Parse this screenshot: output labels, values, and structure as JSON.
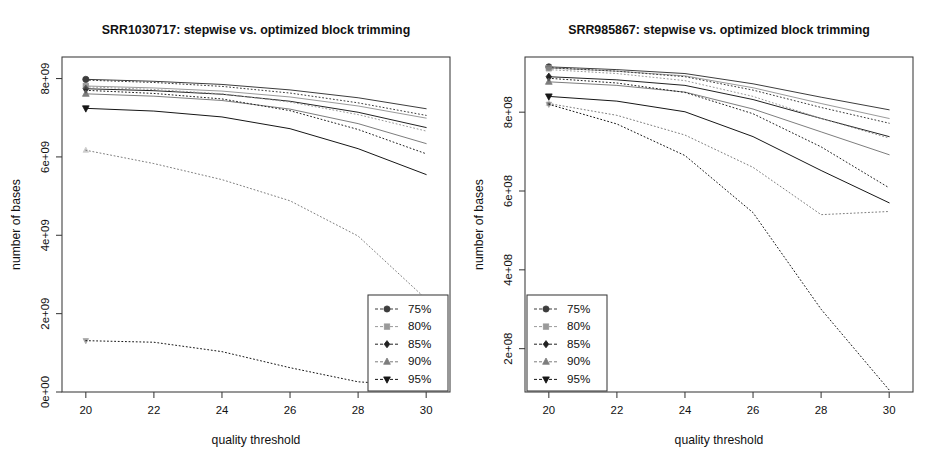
{
  "figure": {
    "width": 926,
    "height": 465,
    "background": "#ffffff",
    "ink": "#111111",
    "axis_color": "#3a3a3a"
  },
  "series_styles": [
    {
      "key": "75",
      "label": "75%",
      "marker": "circle",
      "color": "#3d3d3d"
    },
    {
      "key": "80",
      "label": "80%",
      "marker": "square",
      "color": "#9a9a9a"
    },
    {
      "key": "85",
      "label": "85%",
      "marker": "diamond",
      "color": "#222222"
    },
    {
      "key": "90",
      "label": "90%",
      "marker": "triangle-up",
      "color": "#7d7d7d"
    },
    {
      "key": "95",
      "label": "95%",
      "marker": "triangle-down",
      "color": "#161616"
    }
  ],
  "method_styles": [
    {
      "key": "optimized",
      "dash": "none",
      "width": 1.0
    },
    {
      "key": "stepwise",
      "dash": "1,2.6",
      "width": 1.0
    }
  ],
  "legend": {
    "entries": [
      "75%",
      "80%",
      "85%",
      "90%",
      "95%"
    ]
  },
  "chart_data": [
    {
      "type": "line",
      "panel": "left",
      "title": "SRR1030717: stepwise vs. optimized block trimming",
      "xlabel": "quality threshold",
      "ylabel": "number of bases",
      "x": [
        20,
        22,
        24,
        26,
        28,
        30
      ],
      "xlim": [
        19.3,
        30.7
      ],
      "ylim": [
        0,
        8550000000.0
      ],
      "xticks": [
        20,
        22,
        24,
        26,
        28,
        30
      ],
      "xtick_labels": [
        "20",
        "22",
        "24",
        "26",
        "28",
        "30"
      ],
      "yticks": [
        0,
        2000000000,
        4000000000,
        6000000000,
        8000000000
      ],
      "ytick_labels": [
        "0e+00",
        "2e+09",
        "4e+09",
        "6e+09",
        "8e+09"
      ],
      "grid": false,
      "legend_position": "bottom-right",
      "series": [
        {
          "name": "75% optimized",
          "quality": "75",
          "method": "optimized",
          "values": [
            7980000000,
            7930000000,
            7850000000,
            7710000000,
            7510000000,
            7230000000
          ]
        },
        {
          "name": "80% optimized",
          "quality": "80",
          "method": "optimized",
          "values": [
            7810000000,
            7760000000,
            7680000000,
            7530000000,
            7300000000,
            6990000000
          ]
        },
        {
          "name": "85% optimized",
          "quality": "85",
          "method": "optimized",
          "values": [
            7740000000,
            7690000000,
            7600000000,
            7420000000,
            7140000000,
            6750000000
          ]
        },
        {
          "name": "90% optimized",
          "quality": "90",
          "method": "optimized",
          "values": [
            7610000000,
            7550000000,
            7440000000,
            7220000000,
            6850000000,
            6340000000
          ]
        },
        {
          "name": "95% optimized",
          "quality": "95",
          "method": "optimized",
          "values": [
            7240000000,
            7170000000,
            7020000000,
            6720000000,
            6210000000,
            5550000000
          ]
        },
        {
          "name": "75% stepwise",
          "quality": "75",
          "method": "stepwise",
          "values": [
            7960000000,
            7900000000,
            7800000000,
            7630000000,
            7380000000,
            7060000000
          ]
        },
        {
          "name": "80% stepwise",
          "quality": "80",
          "method": "stepwise",
          "values": [
            7790000000,
            7720000000,
            7610000000,
            7400000000,
            7080000000,
            6660000000
          ]
        },
        {
          "name": "85% stepwise",
          "quality": "85",
          "method": "stepwise",
          "values": [
            7700000000,
            7620000000,
            7480000000,
            7180000000,
            6700000000,
            6080000000
          ]
        },
        {
          "name": "90% stepwise",
          "quality": "90",
          "method": "stepwise",
          "values": [
            6170000000,
            5830000000,
            5420000000,
            4880000000,
            3980000000,
            2370000000
          ]
        },
        {
          "name": "95% stepwise",
          "quality": "95",
          "method": "stepwise",
          "values": [
            1310000000,
            1270000000,
            1030000000,
            620000000,
            260000000,
            150000000
          ]
        }
      ]
    },
    {
      "type": "line",
      "panel": "right",
      "title": "SRR985867: stepwise vs. optimized block trimming",
      "xlabel": "quality threshold",
      "ylabel": "number of bases",
      "x": [
        20,
        22,
        24,
        26,
        28,
        30
      ],
      "xlim": [
        19.3,
        30.7
      ],
      "ylim": [
        90000000,
        940000000
      ],
      "xticks": [
        20,
        22,
        24,
        26,
        28,
        30
      ],
      "xtick_labels": [
        "20",
        "22",
        "24",
        "26",
        "28",
        "30"
      ],
      "yticks": [
        200000000,
        400000000,
        600000000,
        800000000
      ],
      "ytick_labels": [
        "2e+08",
        "4e+08",
        "6e+08",
        "8e+08"
      ],
      "grid": false,
      "legend_position": "bottom-left",
      "series": [
        {
          "name": "75% optimized",
          "quality": "75",
          "method": "optimized",
          "values": [
            915000000,
            908000000,
            898000000,
            872000000,
            838000000,
            806000000
          ]
        },
        {
          "name": "80% optimized",
          "quality": "80",
          "method": "optimized",
          "values": [
            912000000,
            904000000,
            892000000,
            862000000,
            822000000,
            784000000
          ]
        },
        {
          "name": "85% optimized",
          "quality": "85",
          "method": "optimized",
          "values": [
            890000000,
            882000000,
            868000000,
            832000000,
            784000000,
            738000000
          ]
        },
        {
          "name": "90% optimized",
          "quality": "90",
          "method": "optimized",
          "values": [
            877000000,
            868000000,
            851000000,
            808000000,
            750000000,
            692000000
          ]
        },
        {
          "name": "95% optimized",
          "quality": "95",
          "method": "optimized",
          "values": [
            840000000,
            828000000,
            801000000,
            738000000,
            652000000,
            570000000
          ]
        },
        {
          "name": "75% stepwise",
          "quality": "75",
          "method": "stepwise",
          "values": [
            913000000,
            904000000,
            890000000,
            856000000,
            812000000,
            772000000
          ]
        },
        {
          "name": "80% stepwise",
          "quality": "80",
          "method": "stepwise",
          "values": [
            908000000,
            898000000,
            880000000,
            840000000,
            784000000,
            734000000
          ]
        },
        {
          "name": "85% stepwise",
          "quality": "85",
          "method": "stepwise",
          "values": [
            886000000,
            874000000,
            850000000,
            796000000,
            712000000,
            608000000
          ]
        },
        {
          "name": "90% stepwise",
          "quality": "90",
          "method": "stepwise",
          "values": [
            822000000,
            792000000,
            742000000,
            660000000,
            540000000,
            548000000
          ]
        },
        {
          "name": "95% stepwise",
          "quality": "95",
          "method": "stepwise",
          "values": [
            820000000,
            770000000,
            690000000,
            545000000,
            300000000,
            95000000
          ]
        }
      ]
    }
  ]
}
